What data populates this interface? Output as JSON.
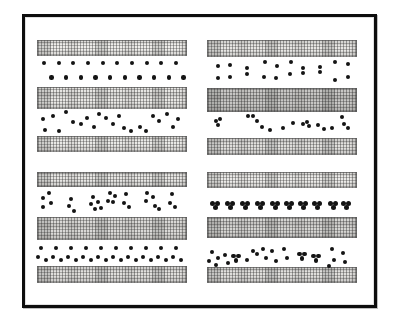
{
  "figure": {
    "background": "#ffffff",
    "dot_color": "#141414",
    "bar_fill": "#f3f2ef",
    "default_dot_radius": 2.2,
    "frame": {
      "x": 22,
      "y": 14,
      "w": 355,
      "h": 294,
      "border_color": "#0d0d0d",
      "border_width": 3
    },
    "bars": [
      {
        "x": 37,
        "y": 40,
        "w": 150,
        "h": 16,
        "shade": 0.02
      },
      {
        "x": 207,
        "y": 40,
        "w": 150,
        "h": 17,
        "shade": 0.05
      },
      {
        "x": 37,
        "y": 87,
        "w": 150,
        "h": 22,
        "shade": 0.05
      },
      {
        "x": 207,
        "y": 88,
        "w": 150,
        "h": 24,
        "shade": 0.18
      },
      {
        "x": 37,
        "y": 136,
        "w": 150,
        "h": 16,
        "shade": 0.04
      },
      {
        "x": 207,
        "y": 138,
        "w": 150,
        "h": 17,
        "shade": 0.08
      },
      {
        "x": 37,
        "y": 172,
        "w": 150,
        "h": 15,
        "shade": 0.05
      },
      {
        "x": 207,
        "y": 172,
        "w": 150,
        "h": 16,
        "shade": 0.03
      },
      {
        "x": 37,
        "y": 217,
        "w": 150,
        "h": 23,
        "shade": 0.1
      },
      {
        "x": 207,
        "y": 217,
        "w": 150,
        "h": 21,
        "shade": 0.12
      },
      {
        "x": 37,
        "y": 266,
        "w": 150,
        "h": 17,
        "shade": 0.08
      },
      {
        "x": 207,
        "y": 267,
        "w": 150,
        "h": 16,
        "shade": 0.08
      }
    ],
    "dot_groups": [
      {
        "name": "top-left-even-rows",
        "dots": [
          [
            44,
            63
          ],
          [
            58.7,
            63
          ],
          [
            73.3,
            63
          ],
          [
            88,
            63
          ],
          [
            102.7,
            63
          ],
          [
            117.3,
            63
          ],
          [
            132,
            63
          ],
          [
            146.7,
            63
          ],
          [
            161.3,
            63
          ],
          [
            176,
            63
          ],
          [
            51.5,
            77.5
          ],
          [
            66.2,
            77.5
          ],
          [
            80.8,
            77.5
          ],
          [
            95.5,
            77.5
          ],
          [
            110.1,
            77.5
          ],
          [
            124.8,
            77.5
          ],
          [
            139.4,
            77.5
          ],
          [
            154.1,
            77.5
          ],
          [
            168.7,
            77.5
          ],
          [
            183.4,
            77.5
          ]
        ]
      },
      {
        "name": "top-left-random-scatter",
        "dots": [
          [
            43,
            119
          ],
          [
            45,
            130
          ],
          [
            53,
            116
          ],
          [
            59,
            131
          ],
          [
            66,
            112
          ],
          [
            73,
            122
          ],
          [
            81,
            124
          ],
          [
            87,
            118
          ],
          [
            94,
            127
          ],
          [
            99,
            114
          ],
          [
            106,
            118
          ],
          [
            113,
            124
          ],
          [
            119,
            116
          ],
          [
            124,
            128
          ],
          [
            131,
            131
          ],
          [
            140,
            127
          ],
          [
            146,
            131
          ],
          [
            153,
            116
          ],
          [
            159,
            121
          ],
          [
            167,
            114
          ],
          [
            173,
            127
          ],
          [
            178,
            119
          ]
        ]
      },
      {
        "name": "top-right-vertical-pairs",
        "dots": [
          [
            218,
            66
          ],
          [
            218,
            78
          ],
          [
            230,
            65
          ],
          [
            230,
            77
          ],
          [
            247,
            68
          ],
          [
            247,
            74
          ],
          [
            265,
            62
          ],
          [
            264,
            77
          ],
          [
            277,
            66
          ],
          [
            276,
            78
          ],
          [
            291,
            62
          ],
          [
            290,
            74
          ],
          [
            303,
            68
          ],
          [
            303,
            73
          ],
          [
            320,
            67
          ],
          [
            320,
            72
          ],
          [
            335,
            62
          ],
          [
            335,
            80
          ],
          [
            348,
            64
          ],
          [
            348,
            77
          ]
        ]
      },
      {
        "name": "top-right-scatter-clusters",
        "dots": [
          [
            216,
            121
          ],
          [
            220,
            119
          ],
          [
            218,
            125
          ],
          [
            248,
            116
          ],
          [
            253,
            116
          ],
          [
            257,
            121
          ],
          [
            262,
            127
          ],
          [
            270,
            130
          ],
          [
            283,
            128
          ],
          [
            293,
            123
          ],
          [
            303,
            124
          ],
          [
            307,
            122
          ],
          [
            309,
            126
          ],
          [
            318,
            125
          ],
          [
            324,
            129
          ],
          [
            332,
            128
          ],
          [
            342,
            117
          ],
          [
            344,
            124
          ],
          [
            348,
            128
          ]
        ]
      },
      {
        "name": "bottom-left-irregular-clusters",
        "dots": [
          [
            43,
            198
          ],
          [
            49,
            193
          ],
          [
            51,
            203
          ],
          [
            43,
            207
          ],
          [
            71,
            199
          ],
          [
            69,
            206
          ],
          [
            74,
            211
          ],
          [
            93,
            197
          ],
          [
            91,
            204
          ],
          [
            98,
            202
          ],
          [
            95,
            209
          ],
          [
            101,
            208
          ],
          [
            110,
            193
          ],
          [
            115,
            196
          ],
          [
            108,
            201
          ],
          [
            113,
            202
          ],
          [
            126,
            194
          ],
          [
            124,
            203
          ],
          [
            129,
            207
          ],
          [
            147,
            193
          ],
          [
            146,
            201
          ],
          [
            153,
            197
          ],
          [
            155,
            206
          ],
          [
            159,
            209
          ],
          [
            172,
            194
          ],
          [
            170,
            203
          ],
          [
            175,
            207
          ]
        ]
      },
      {
        "name": "bottom-left-regular-triads",
        "dots": [
          [
            41,
            248
          ],
          [
            38,
            257
          ],
          [
            46,
            260
          ],
          [
            56,
            248
          ],
          [
            53,
            257
          ],
          [
            61,
            260
          ],
          [
            71,
            248
          ],
          [
            68,
            257
          ],
          [
            76,
            260
          ],
          [
            86,
            248
          ],
          [
            83,
            257
          ],
          [
            91,
            260
          ],
          [
            101,
            248
          ],
          [
            98,
            257
          ],
          [
            106,
            260
          ],
          [
            116,
            248
          ],
          [
            113,
            257
          ],
          [
            121,
            260
          ],
          [
            131,
            248
          ],
          [
            128,
            257
          ],
          [
            136,
            260
          ],
          [
            146,
            248
          ],
          [
            143,
            257
          ],
          [
            151,
            260
          ],
          [
            161,
            248
          ],
          [
            158,
            257
          ],
          [
            166,
            260
          ],
          [
            176,
            248
          ],
          [
            173,
            257
          ],
          [
            181,
            260
          ]
        ]
      },
      {
        "name": "bottom-right-tight-trefoils",
        "r": 2.5,
        "dots": [
          [
            212.5,
            203
          ],
          [
            217.5,
            203
          ],
          [
            215,
            207.5
          ],
          [
            227.5,
            203
          ],
          [
            232.5,
            203
          ],
          [
            230,
            207.5
          ],
          [
            242.5,
            203
          ],
          [
            247.5,
            203
          ],
          [
            245,
            207.5
          ],
          [
            257.5,
            203
          ],
          [
            262.5,
            203
          ],
          [
            260,
            207.5
          ],
          [
            272.5,
            203
          ],
          [
            277.5,
            203
          ],
          [
            275,
            207.5
          ],
          [
            286.5,
            203
          ],
          [
            291.5,
            203
          ],
          [
            289,
            207.5
          ],
          [
            300.5,
            203
          ],
          [
            305.5,
            203
          ],
          [
            303,
            207.5
          ],
          [
            314.5,
            203
          ],
          [
            319.5,
            203
          ],
          [
            317,
            207.5
          ],
          [
            330.5,
            203
          ],
          [
            335.5,
            203
          ],
          [
            333,
            207.5
          ],
          [
            343.5,
            203
          ],
          [
            348.5,
            203
          ],
          [
            346,
            207.5
          ]
        ]
      },
      {
        "name": "bottom-right-mixed-clusters",
        "dots": [
          [
            212,
            252
          ],
          [
            209,
            261
          ],
          [
            218,
            258
          ],
          [
            216,
            265
          ],
          [
            225,
            255
          ],
          [
            228,
            263
          ],
          [
            233.5,
            256
          ],
          [
            238.5,
            256
          ],
          [
            236,
            260.5
          ],
          [
            247,
            260
          ],
          [
            253,
            251
          ],
          [
            257,
            254
          ],
          [
            263,
            249
          ],
          [
            266,
            258
          ],
          [
            272,
            251
          ],
          [
            276,
            261
          ],
          [
            284,
            249
          ],
          [
            287,
            258
          ],
          [
            299.5,
            254
          ],
          [
            304.5,
            254
          ],
          [
            302,
            258.5
          ],
          [
            313.5,
            256
          ],
          [
            318.5,
            256
          ],
          [
            316,
            260.5
          ],
          [
            332,
            249
          ],
          [
            334,
            260
          ],
          [
            329,
            266
          ],
          [
            343,
            253
          ],
          [
            345,
            262
          ]
        ]
      }
    ]
  }
}
